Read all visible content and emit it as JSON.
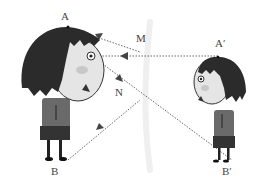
{
  "labels": {
    "A": "A",
    "B": "B",
    "M": "M",
    "N": "N",
    "A_prime": "A′",
    "B_prime": "B′"
  },
  "colors": {
    "hair": "#2b2b2b",
    "face": "#e6e6e6",
    "body": "#5a5a5a",
    "skirt": "#333333",
    "ray": "#666666",
    "mirror": "#f0f0f0"
  }
}
